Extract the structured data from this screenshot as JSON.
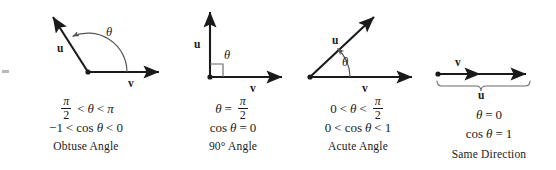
{
  "figure": {
    "background": "#ffffff",
    "ink": "#1a1a1a",
    "arc_color": "#555555",
    "panels": [
      {
        "id": "obtuse",
        "label": "Obtuse Angle",
        "angle_symbol": "θ",
        "vector_u": "u",
        "vector_v": "v",
        "condition_numerator": "π",
        "condition_denominator": "2",
        "condition_op1": "<",
        "condition_theta": "θ",
        "condition_op2": "<",
        "condition_rhs": "π",
        "cos_lhs": "−1",
        "cos_op1": "<",
        "cos_fn": "cos",
        "cos_theta": "θ",
        "cos_op2": "<",
        "cos_rhs": "0"
      },
      {
        "id": "right",
        "label": "90° Angle",
        "angle_symbol": "θ",
        "vector_u": "u",
        "vector_v": "v",
        "condition_theta": "θ",
        "condition_eq": "=",
        "condition_numerator": "π",
        "condition_denominator": "2",
        "cos_fn": "cos",
        "cos_theta": "θ",
        "cos_eq": "=",
        "cos_rhs": "0"
      },
      {
        "id": "acute",
        "label": "Acute Angle",
        "angle_symbol": "θ",
        "vector_u": "u",
        "vector_v": "v",
        "condition_lhs": "0",
        "condition_op1": "<",
        "condition_theta": "θ",
        "condition_op2": "<",
        "condition_numerator": "π",
        "condition_denominator": "2",
        "cos_lhs": "0",
        "cos_op1": "<",
        "cos_fn": "cos",
        "cos_theta": "θ",
        "cos_op2": "<",
        "cos_rhs": "1"
      },
      {
        "id": "same",
        "label": "Same Direction",
        "vector_u": "u",
        "vector_v": "v",
        "condition_theta": "θ",
        "condition_eq": "=",
        "condition_rhs": "0",
        "cos_fn": "cos",
        "cos_theta": "θ",
        "cos_eq": "=",
        "cos_rhs": "1"
      }
    ]
  }
}
